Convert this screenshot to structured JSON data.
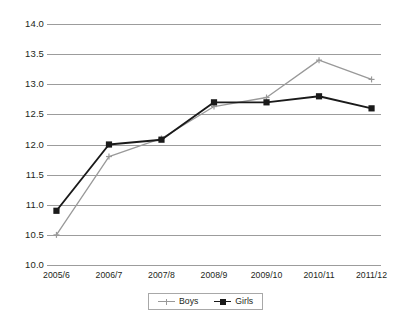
{
  "chart_data": {
    "type": "line",
    "title": "",
    "subtitle": "",
    "xlabel": "",
    "ylabel": "",
    "categories": [
      "2005/6",
      "2006/7",
      "2007/8",
      "2008/9",
      "2009/10",
      "2010/11",
      "2011/12"
    ],
    "ylim": [
      10.0,
      14.0
    ],
    "ytick_step": 0.5,
    "yticks": [
      "10.0",
      "10.5",
      "11.0",
      "11.5",
      "12.0",
      "12.5",
      "13.0",
      "13.5",
      "14.0"
    ],
    "ytick_values": [
      10.0,
      10.5,
      11.0,
      11.5,
      12.0,
      12.5,
      13.0,
      13.5,
      14.0
    ],
    "grid": true,
    "grid_axis": "y",
    "legend_position": "bottom",
    "series": [
      {
        "name": "Boys",
        "color": "#999999",
        "marker": "cross",
        "values": [
          10.5,
          11.8,
          12.1,
          12.63,
          12.78,
          13.4,
          13.08
        ]
      },
      {
        "name": "Girls",
        "color": "#1a1a1a",
        "marker": "square",
        "values": [
          10.9,
          12.0,
          12.08,
          12.7,
          12.7,
          12.8,
          12.6
        ]
      }
    ]
  },
  "legend": {
    "entries": [
      {
        "label": "Boys"
      },
      {
        "label": "Girls"
      }
    ]
  },
  "colors": {
    "boys": "#999999",
    "girls": "#1a1a1a",
    "grid": "#9c9c9c",
    "text": "#231f20",
    "legend_border": "#a8a8a8",
    "background": "#ffffff"
  }
}
